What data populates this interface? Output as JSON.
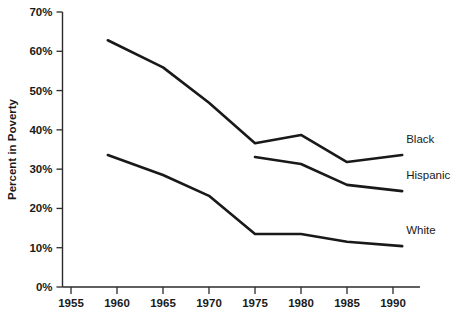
{
  "chart_data": {
    "type": "line",
    "title": "",
    "subtitle": "",
    "xlabel": "",
    "ylabel": "Percent in Poverty",
    "xlim": [
      1953,
      1993
    ],
    "ylim": [
      0,
      70
    ],
    "grid": false,
    "legend_position": "right-inline",
    "x_ticks": [
      1955,
      1960,
      1965,
      1970,
      1975,
      1980,
      1985,
      1990
    ],
    "x_tick_labels": [
      "1955",
      "1960",
      "1965",
      "1970",
      "1975",
      "1980",
      "1985",
      "1990"
    ],
    "y_ticks": [
      0,
      10,
      20,
      30,
      40,
      50,
      60,
      70
    ],
    "y_tick_labels": [
      "0%",
      "10%",
      "20%",
      "30%",
      "40%",
      "50%",
      "60%",
      "70%"
    ],
    "series": [
      {
        "name": "Black",
        "label": "Black",
        "color": "#191919",
        "x": [
          1959,
          1965,
          1970,
          1975,
          1980,
          1985,
          1991
        ],
        "values": [
          62.8,
          55.9,
          46.9,
          36.6,
          38.7,
          31.8,
          33.6
        ]
      },
      {
        "name": "Hispanic",
        "label": "Hispanic",
        "color": "#191919",
        "x": [
          1975,
          1980,
          1985,
          1991
        ],
        "values": [
          33.1,
          31.3,
          26.0,
          24.4
        ]
      },
      {
        "name": "White",
        "label": "White",
        "color": "#191919",
        "x": [
          1959,
          1965,
          1970,
          1975,
          1980,
          1985,
          1991
        ],
        "values": [
          33.6,
          28.5,
          23.2,
          13.5,
          13.5,
          11.5,
          10.4
        ]
      }
    ]
  },
  "labels": {
    "black": "Black",
    "hispanic": "Hispanic",
    "white": "White",
    "y_axis_title": "Percent in Poverty"
  }
}
